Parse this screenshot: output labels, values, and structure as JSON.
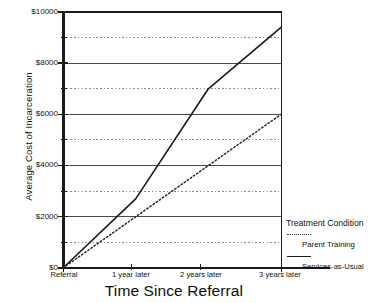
{
  "chart_data": {
    "type": "line",
    "title": "",
    "xlabel": "Time Since Referral",
    "ylabel": "Average Cost of Incarceration",
    "x": [
      0,
      1,
      2,
      3
    ],
    "categories": [
      "Referral",
      "1 year later",
      "2 years later",
      "3 years later"
    ],
    "ylim": [
      0,
      10000
    ],
    "ytick_values": [
      0,
      2000,
      4000,
      6000,
      8000,
      10000
    ],
    "ytick_labels": [
      "$0",
      "$2000",
      "$4000",
      "$6000",
      "$8000",
      "$10000"
    ],
    "gridlines_major": [
      2000,
      4000,
      6000,
      8000,
      10000
    ],
    "gridlines_minor": [
      1000,
      3000,
      5000,
      7000,
      9000
    ],
    "grid": true,
    "grid_major_style": "solid",
    "grid_minor_style": "dotted",
    "legend_position": "right-bottom-outside",
    "legend_title": "Treatment Condition",
    "series": [
      {
        "name": "Parent Training",
        "style": "dotted",
        "color": "#2a2a2a",
        "values": [
          0,
          2000,
          4000,
          6000
        ]
      },
      {
        "name": "Services-as-Usual",
        "style": "solid",
        "color": "#1a1a1a",
        "values": [
          0,
          2700,
          7000,
          9400
        ]
      }
    ]
  },
  "axes": {
    "y_title": "Average Cost of Incarceration",
    "x_title": "Time Since Referral",
    "y_tick_labels": [
      "$10000",
      "$8000",
      "$6000",
      "$4000",
      "$2000",
      "$0"
    ],
    "x_tick_labels": [
      "Referral",
      "1 year later",
      "2 years later",
      "3 years later"
    ]
  },
  "legend": {
    "title": "Treatment Condition",
    "items": [
      {
        "label": "Parent Training",
        "style": "dotted"
      },
      {
        "label": "Services-as-Usual",
        "style": "solid"
      }
    ]
  }
}
